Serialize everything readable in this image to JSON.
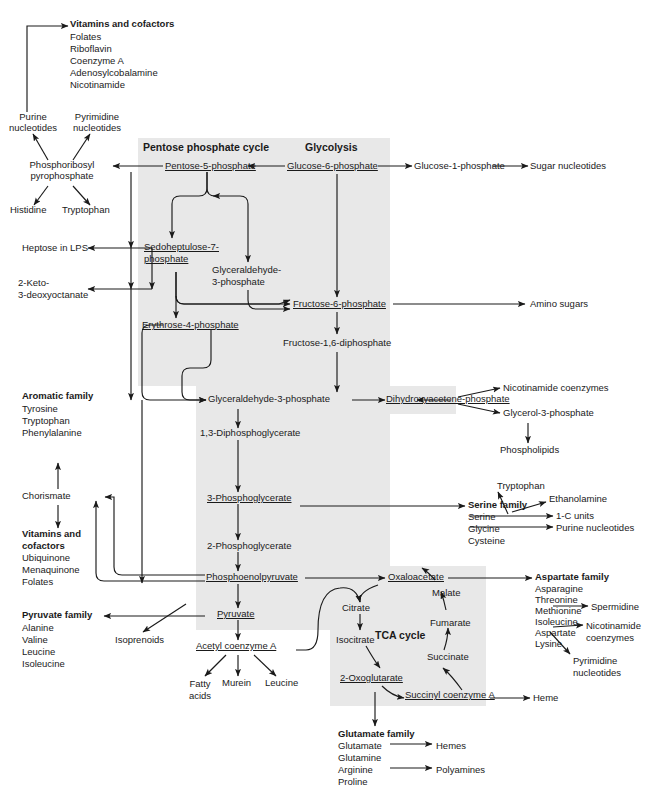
{
  "figure": {
    "type": "metabolic-pathway-diagram"
  },
  "sections": {
    "pentose_phosphate_cycle": "Pentose phosphate cycle",
    "glycolysis": "Glycolysis",
    "tca_cycle": "TCA cycle"
  },
  "top": {
    "vitamins_header": "Vitamins and cofactors",
    "vitamins_items": [
      "Folates",
      "Riboflavin",
      "Coenzyme A",
      "Adenosylcobalamine",
      "Nicotinamide"
    ],
    "purine_nucleotides": "Purine\nnucleotides",
    "pyrimidine_nucleotides": "Pyrimidine\nnucleotides",
    "prpp": "Phosphoribosyl\npyrophosphate",
    "histidine": "Histidine",
    "tryptophan": "Tryptophan"
  },
  "ppc": {
    "pentose5p": "Pentose-5-phosphate",
    "sedoheptulose7p": "Sedoheptulose-7-\nphosphate",
    "gap_branch": "Glyceraldehyde-\n3-phosphate",
    "erythrose4p": "Erythrose-4-phosphate",
    "heptose_lps": "Heptose in LPS",
    "keto_deoxyoctanate": "2-Keto-\n3-deoxyoctanate"
  },
  "glycolysis": {
    "glucose6p": "Glucose-6-phosphate",
    "glucose1p": "Glucose-1-phosphate",
    "sugar_nucleotides": "Sugar nucleotides",
    "fructose6p": "Fructose-6-phosphate",
    "amino_sugars": "Amino sugars",
    "fructose16dp": "Fructose-1,6-diphosphate",
    "gap": "Glyceraldehyde-3-phosphate",
    "dhap": "Dihydroxyacetone-phosphate",
    "nicotinamide_coenzymes": "Nicotinamide coenzymes",
    "glycerol3p": "Glycerol-3-phosphate",
    "phospholipids": "Phospholipids",
    "dpg13": "1,3-Diphosphoglycerate",
    "pg3": "3-Phosphoglycerate",
    "pg2": "2-Phosphoglycerate",
    "pep": "Phosphoenolpyruvate",
    "pyruvate": "Pyruvate",
    "acetyl_coa": "Acetyl coenzyme A",
    "fatty_acids": "Fatty\nacids",
    "murein": "Murein",
    "leucine": "Leucine"
  },
  "tca": {
    "oxaloacetate": "Oxaloacetate",
    "citrate": "Citrate",
    "isocitrate": "Isocitrate",
    "oxoglutarate2": "2-Oxoglutarate",
    "succinyl_coa": "Succinyl coenzyme A",
    "succinate": "Succinate",
    "fumarate": "Fumarate",
    "malate": "Malate",
    "heme": "Heme"
  },
  "families": {
    "aromatic": {
      "header": "Aromatic family",
      "items": [
        "Tyrosine",
        "Tryptophan",
        "Phenylalanine"
      ]
    },
    "chorismate": "Chorismate",
    "vitamins_cofactors": {
      "header": "Vitamins and\ncofactors",
      "items": [
        "Ubiquinone",
        "Menaquinone",
        "Folates"
      ]
    },
    "pyruvate": {
      "header": "Pyruvate family",
      "items": [
        "Alanine",
        "Valine",
        "Leucine",
        "Isoleucine"
      ]
    },
    "isoprenoids": "Isoprenoids",
    "serine": {
      "header": "Serine family",
      "items": [
        "Serine",
        "Glycine",
        "Cysteine"
      ],
      "products": [
        "Tryptophan",
        "Ethanolamine",
        "1-C units",
        "Purine nucleotides"
      ]
    },
    "aspartate": {
      "header": "Aspartate family",
      "items": [
        "Asparagine",
        "Threonine",
        "Methionine",
        "Isoleucine",
        "Aspartate",
        "Lysine"
      ],
      "products": [
        "Spermidine",
        "Nicotinamide\ncoenzymes",
        "Pyrimidine\nnucleotides"
      ]
    },
    "glutamate": {
      "header": "Glutamate family",
      "items": [
        "Glutamate",
        "Glutamine",
        "Arginine",
        "Proline"
      ],
      "products": [
        "Hemes",
        "Polyamines"
      ]
    }
  },
  "colors": {
    "shade": "#e8e8e8",
    "line": "#1a1a1a",
    "text": "#1a1a1a"
  }
}
